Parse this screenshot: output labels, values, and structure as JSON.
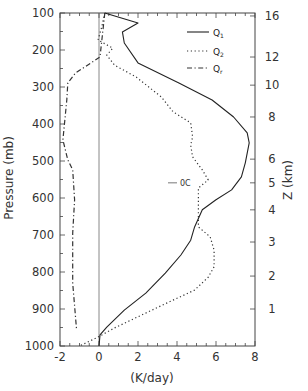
{
  "chart_data": {
    "type": "line",
    "title": "",
    "xlabel": "(K/day)",
    "ylabel": "Pressure (mb)",
    "y2label": "Z (km)",
    "xlim": [
      -2,
      8
    ],
    "ylim": [
      1000,
      100
    ],
    "y_inverted": true,
    "grid": false,
    "legend_position": "upper right",
    "x_ticks": [
      -2,
      0,
      2,
      4,
      6,
      8
    ],
    "x_tick_labels": [
      "-2",
      "0",
      "2",
      "4",
      "6",
      "8"
    ],
    "x_minor_step": 0.5,
    "y_ticks": [
      100,
      200,
      300,
      400,
      500,
      600,
      700,
      800,
      900,
      1000
    ],
    "y_tick_labels": [
      "100",
      "200",
      "300",
      "400",
      "500",
      "600",
      "700",
      "800",
      "900",
      "1000"
    ],
    "y_minor_step": 50,
    "y2_ticks": [
      {
        "label": "16",
        "pressure": 108
      },
      {
        "label": "12",
        "pressure": 219
      },
      {
        "label": "10",
        "pressure": 295
      },
      {
        "label": "8",
        "pressure": 381
      },
      {
        "label": "6",
        "pressure": 495
      },
      {
        "label": "5",
        "pressure": 559
      },
      {
        "label": "4",
        "pressure": 632
      },
      {
        "label": "3",
        "pressure": 719
      },
      {
        "label": "2",
        "pressure": 811
      },
      {
        "label": "1",
        "pressure": 900
      }
    ],
    "reference_line": {
      "x": 0,
      "style": "solid",
      "color": "#888888"
    },
    "annotations": [
      {
        "text": "0C",
        "pressure": 559,
        "x": 4.6,
        "marker": "dash"
      }
    ],
    "series": [
      {
        "name": "Q1",
        "legend_main": "Q",
        "legend_sub": "1",
        "style": "solid",
        "color": "#222222",
        "points": [
          [
            0.3,
            100
          ],
          [
            2.0,
            127
          ],
          [
            1.2,
            151
          ],
          [
            1.3,
            181
          ],
          [
            2.0,
            235
          ],
          [
            4.1,
            289
          ],
          [
            5.8,
            335
          ],
          [
            6.9,
            381
          ],
          [
            7.6,
            424
          ],
          [
            7.7,
            451
          ],
          [
            7.5,
            505
          ],
          [
            7.3,
            543
          ],
          [
            6.8,
            578
          ],
          [
            6.0,
            605
          ],
          [
            5.3,
            632
          ],
          [
            4.9,
            678
          ],
          [
            4.7,
            714
          ],
          [
            4.2,
            754
          ],
          [
            3.4,
            803
          ],
          [
            2.4,
            857
          ],
          [
            1.3,
            903
          ],
          [
            0.4,
            949
          ],
          [
            0.05,
            970
          ],
          [
            0.0,
            1000
          ]
        ]
      },
      {
        "name": "Q2",
        "legend_main": "Q",
        "legend_sub": "2",
        "style": "dotted",
        "color": "#333333",
        "points": [
          [
            0.3,
            100
          ],
          [
            0.15,
            136
          ],
          [
            -0.05,
            173
          ],
          [
            0.7,
            195
          ],
          [
            0.4,
            214
          ],
          [
            0.8,
            241
          ],
          [
            1.9,
            273
          ],
          [
            3.2,
            327
          ],
          [
            3.8,
            367
          ],
          [
            4.7,
            397
          ],
          [
            4.8,
            435
          ],
          [
            4.7,
            457
          ],
          [
            4.8,
            489
          ],
          [
            5.3,
            524
          ],
          [
            5.6,
            551
          ],
          [
            5.1,
            573
          ],
          [
            5.1,
            613
          ],
          [
            5.1,
            678
          ],
          [
            5.7,
            705
          ],
          [
            5.9,
            741
          ],
          [
            5.9,
            786
          ],
          [
            5.6,
            814
          ],
          [
            4.9,
            849
          ],
          [
            3.8,
            876
          ],
          [
            2.2,
            916
          ],
          [
            0.8,
            951
          ],
          [
            -0.05,
            976
          ],
          [
            -1.0,
            1000
          ]
        ]
      },
      {
        "name": "Qr",
        "legend_main": "Q",
        "legend_sub": "r",
        "style": "dashdot",
        "color": "#333333",
        "points": [
          [
            0.3,
            100
          ],
          [
            0.05,
            219
          ],
          [
            -1.2,
            262
          ],
          [
            -1.6,
            289
          ],
          [
            -1.65,
            335
          ],
          [
            -1.85,
            443
          ],
          [
            -1.6,
            497
          ],
          [
            -1.35,
            524
          ],
          [
            -1.25,
            605
          ],
          [
            -1.35,
            695
          ],
          [
            -1.35,
            830
          ],
          [
            -1.15,
            957
          ]
        ]
      }
    ]
  }
}
